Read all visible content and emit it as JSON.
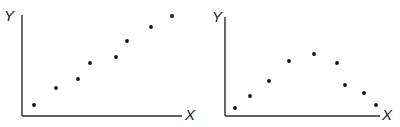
{
  "chart_data": [
    {
      "type": "scatter",
      "title": "",
      "xlabel": "X",
      "ylabel": "Y",
      "grid": false,
      "legend": null,
      "description": "Positive linear relationship",
      "axes_px": {
        "origin": [
          22,
          116
        ],
        "x_end": 182,
        "y_top": 15
      },
      "label_px": {
        "x": [
          185,
          120
        ],
        "y": [
          4,
          21
        ]
      },
      "points_px": [
        [
          34,
          105
        ],
        [
          56,
          88
        ],
        [
          78,
          79
        ],
        [
          90,
          63
        ],
        [
          116,
          57
        ],
        [
          127,
          41
        ],
        [
          151,
          27
        ],
        [
          172,
          16
        ]
      ],
      "x": [
        0.08,
        0.21,
        0.35,
        0.43,
        0.59,
        0.66,
        0.81,
        0.94
      ],
      "y": [
        0.11,
        0.28,
        0.37,
        0.52,
        0.58,
        0.74,
        0.88,
        0.99
      ]
    },
    {
      "type": "scatter",
      "title": "",
      "xlabel": "X",
      "ylabel": "Y",
      "grid": false,
      "legend": null,
      "description": "Curvilinear (inverted-U) relationship",
      "axes_px": {
        "origin": [
          225,
          116
        ],
        "x_end": 380,
        "y_top": 17
      },
      "label_px": {
        "x": [
          382,
          120
        ],
        "y": [
          212,
          22
        ]
      },
      "points_px": [
        [
          235,
          108
        ],
        [
          250,
          96
        ],
        [
          269,
          81
        ],
        [
          289,
          61
        ],
        [
          314,
          54
        ],
        [
          337,
          63
        ],
        [
          345,
          85
        ],
        [
          364,
          93
        ],
        [
          376,
          105
        ]
      ],
      "x": [
        0.06,
        0.16,
        0.28,
        0.41,
        0.57,
        0.72,
        0.77,
        0.9,
        0.97
      ],
      "y": [
        0.08,
        0.2,
        0.35,
        0.55,
        0.62,
        0.53,
        0.31,
        0.23,
        0.11
      ]
    }
  ]
}
